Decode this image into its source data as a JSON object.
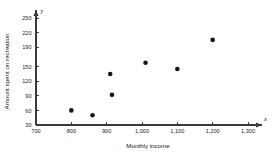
{
  "chart_data": {
    "type": "scatter",
    "title": "",
    "xlabel": "Monthly income",
    "ylabel": "Amount spent on recreation",
    "x_axis_symbol": "x",
    "y_axis_symbol": "y",
    "xlim": [
      700,
      1300
    ],
    "ylim": [
      30,
      250
    ],
    "grid": false,
    "legend": false,
    "xticks": [
      700,
      800,
      900,
      1000,
      1100,
      1200,
      1300
    ],
    "xticklabels": [
      "700",
      "800",
      "900",
      "1,000",
      "1,100",
      "1,200",
      "1,300"
    ],
    "yticks": [
      30,
      60,
      90,
      120,
      150,
      190,
      220,
      250
    ],
    "yticklabels": [
      "30",
      "60",
      "90",
      "120",
      "150",
      "190",
      "220",
      "250"
    ],
    "points": [
      {
        "x": 800,
        "y": 60
      },
      {
        "x": 860,
        "y": 50
      },
      {
        "x": 915,
        "y": 92
      },
      {
        "x": 910,
        "y": 135
      },
      {
        "x": 1010,
        "y": 158
      },
      {
        "x": 1100,
        "y": 145
      },
      {
        "x": 1200,
        "y": 205
      }
    ],
    "marker": {
      "shape": "circle",
      "size": 2.3,
      "color": "#161616"
    },
    "axis_color": "#3a3a3a"
  }
}
